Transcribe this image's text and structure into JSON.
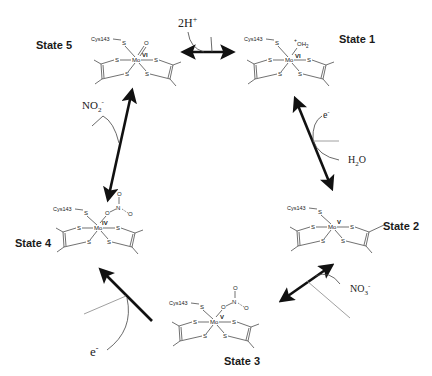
{
  "diagram": {
    "type": "catalytic-cycle",
    "states": [
      {
        "id": "state5",
        "label": "State 5",
        "oxidation": "VI",
        "ligand": "O",
        "cys": "Cys143",
        "metal": "Mo"
      },
      {
        "id": "state1",
        "label": "State 1",
        "oxidation": "VI",
        "ligand": "+OH2",
        "ligand_sup": "+",
        "ligand_main": "OH",
        "ligand_sub": "2",
        "cys": "Cys143",
        "metal": "Mo"
      },
      {
        "id": "state2",
        "label": "State 2",
        "oxidation": "V",
        "ligand": "",
        "cys": "Cys143",
        "metal": "Mo"
      },
      {
        "id": "state3",
        "label": "State 3",
        "oxidation": "V",
        "ligand": "O-NO2",
        "cys": "Cys143",
        "metal": "Mo"
      },
      {
        "id": "state4",
        "label": "State 4",
        "oxidation": "IV",
        "ligand": "O-NO2",
        "cys": "Cys143",
        "metal": "Mo"
      }
    ],
    "atoms": {
      "sulfur": "S",
      "oxygen": "O",
      "nitrogen": "N"
    },
    "species": {
      "protons": {
        "main": "2H",
        "sup": "+"
      },
      "electron_top": {
        "main": "e",
        "sup": "-"
      },
      "water": {
        "main": "H",
        "sub": "2",
        "tail": "O"
      },
      "nitrate": {
        "main": "NO",
        "sub": "3",
        "sup": "-"
      },
      "electron_bottom": {
        "main": "e",
        "sup": "-"
      },
      "nitrite": {
        "main": "NO",
        "sub": "2",
        "sup": "-"
      }
    },
    "transitions": [
      {
        "from": "State 5",
        "to": "State 1",
        "species": "2H+",
        "direction": "bidirectional"
      },
      {
        "from": "State 1",
        "to": "State 2",
        "species": "e- in, H2O out",
        "direction": "bidirectional"
      },
      {
        "from": "State 2",
        "to": "State 3",
        "species": "NO3-",
        "direction": "bidirectional"
      },
      {
        "from": "State 3",
        "to": "State 4",
        "species": "e-",
        "direction": "forward"
      },
      {
        "from": "State 4",
        "to": "State 5",
        "species": "NO2-",
        "direction": "bidirectional"
      }
    ]
  }
}
